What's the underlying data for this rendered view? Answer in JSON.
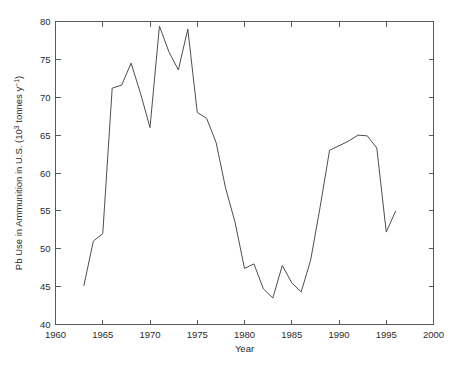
{
  "chart_data": {
    "type": "line",
    "title": "",
    "xlabel": "Year",
    "ylabel": "Pb Use in Ammunition in U.S. (10³ tonnes y⁻¹)",
    "ylabel_parts": {
      "pre": "Pb Use in Ammunition in U.S. (10",
      "sup1": "3",
      "mid": " tonnes y",
      "sup2": "−1",
      "post": ")"
    },
    "xlim": [
      1960,
      2000
    ],
    "ylim": [
      40,
      80
    ],
    "xticks": [
      1960,
      1965,
      1970,
      1975,
      1980,
      1985,
      1990,
      1995,
      2000
    ],
    "xtick_labels": [
      "1960",
      "1965",
      "1970",
      "1975",
      "1980",
      "1985",
      "1990",
      "1995",
      "2000"
    ],
    "yticks": [
      40,
      45,
      50,
      55,
      60,
      65,
      70,
      75,
      80
    ],
    "ytick_labels": [
      "40",
      "45",
      "50",
      "55",
      "60",
      "65",
      "70",
      "75",
      "80"
    ],
    "grid": false,
    "legend": null,
    "line_color": "#4a4f54",
    "series": [
      {
        "name": "Pb Use in Ammunition in U.S.",
        "x": [
          1963,
          1964,
          1965,
          1966,
          1967,
          1968,
          1969,
          1970,
          1971,
          1972,
          1973,
          1974,
          1975,
          1976,
          1977,
          1978,
          1979,
          1980,
          1981,
          1982,
          1983,
          1984,
          1985,
          1986,
          1987,
          1988,
          1989,
          1990,
          1991,
          1992,
          1993,
          1994,
          1995,
          1996
        ],
        "values": [
          45.1,
          51.0,
          52.0,
          71.2,
          71.6,
          74.5,
          70.5,
          66.0,
          79.4,
          76.0,
          73.6,
          79.0,
          68.0,
          67.2,
          64.0,
          58.0,
          53.5,
          47.4,
          48.0,
          44.7,
          43.5,
          47.8,
          45.5,
          44.3,
          48.5,
          55.5,
          63.0,
          63.6,
          64.2,
          65.0,
          64.9,
          63.3,
          52.2,
          55.0
        ]
      }
    ]
  },
  "axes": {
    "x_axis_name": "x-axis",
    "y_axis_name": "y-axis"
  }
}
